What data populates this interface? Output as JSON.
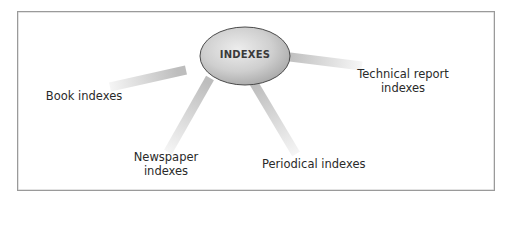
{
  "diagram": {
    "type": "hub-and-spoke",
    "hub": {
      "label": "INDEXES"
    },
    "spokes": [
      {
        "id": "book",
        "line1": "Book indexes",
        "line2": ""
      },
      {
        "id": "newspaper",
        "line1": "Newspaper",
        "line2": "indexes"
      },
      {
        "id": "periodical",
        "line1": "Periodical indexes",
        "line2": ""
      },
      {
        "id": "technical",
        "line1": "Technical report",
        "line2": "indexes"
      }
    ],
    "colors": {
      "frame_border": "#9a9a9a",
      "hub_fill_light": "#e6e6e6",
      "hub_fill_dark": "#a9a9a9",
      "hub_stroke": "#4a4a4a",
      "ray": "#c4c4c4",
      "text": "#2a2a2a"
    }
  }
}
